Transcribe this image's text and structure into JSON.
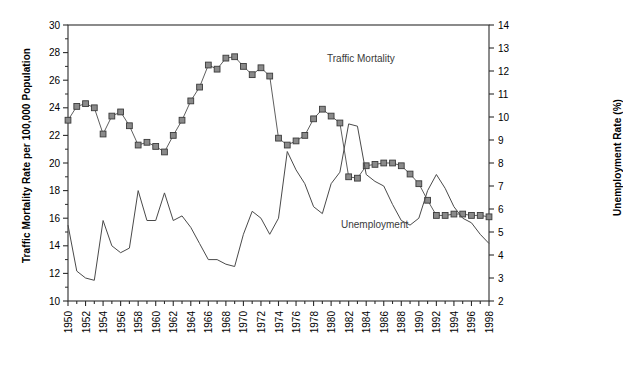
{
  "chart_data": {
    "type": "line",
    "title": "",
    "xlabel": "",
    "ylabel": "Traffic Mortality Rate per 100,000 Population",
    "y2label": "Unemployment Rate (%)",
    "grid": false,
    "legend_position": "inline-annotation",
    "xlim": [
      1950,
      1998
    ],
    "ylim": [
      10,
      30
    ],
    "y2lim": [
      2,
      14
    ],
    "yticks": [
      10,
      12,
      14,
      16,
      18,
      20,
      22,
      24,
      26,
      28,
      30
    ],
    "y2ticks": [
      2,
      3,
      4,
      5,
      6,
      7,
      8,
      9,
      10,
      11,
      12,
      13,
      14
    ],
    "xticks": [
      1950,
      1952,
      1954,
      1956,
      1958,
      1960,
      1962,
      1964,
      1966,
      1968,
      1970,
      1972,
      1974,
      1976,
      1978,
      1980,
      1982,
      1984,
      1986,
      1988,
      1990,
      1992,
      1994,
      1996,
      1998
    ],
    "x": [
      1950,
      1951,
      1952,
      1953,
      1954,
      1955,
      1956,
      1957,
      1958,
      1959,
      1960,
      1961,
      1962,
      1963,
      1964,
      1965,
      1966,
      1967,
      1968,
      1969,
      1970,
      1971,
      1972,
      1973,
      1974,
      1975,
      1976,
      1977,
      1978,
      1979,
      1980,
      1981,
      1982,
      1983,
      1984,
      1985,
      1986,
      1987,
      1988,
      1989,
      1990,
      1991,
      1992,
      1993,
      1994,
      1995,
      1996,
      1997,
      1998
    ],
    "series": [
      {
        "name": "Traffic Mortality",
        "axis": "left",
        "marker": "square",
        "color": "#5f5f5f",
        "annotation": "Traffic Mortality",
        "values": [
          23.1,
          24.1,
          24.3,
          24.0,
          22.1,
          23.4,
          23.7,
          22.7,
          21.3,
          21.5,
          21.2,
          20.8,
          22.0,
          23.1,
          24.5,
          25.5,
          27.1,
          26.8,
          27.6,
          27.7,
          27.0,
          26.4,
          26.9,
          26.3,
          21.8,
          21.3,
          21.6,
          22.0,
          23.2,
          23.9,
          23.4,
          22.9,
          19.0,
          18.9,
          19.8,
          19.9,
          20.0,
          20.0,
          19.8,
          19.2,
          18.5,
          17.3,
          16.2,
          16.2,
          16.3,
          16.3,
          16.2,
          16.2,
          16.1
        ]
      },
      {
        "name": "Unemployment",
        "axis": "right",
        "marker": "none",
        "color": "#4a4a4a",
        "annotation": "Unemployment",
        "values": [
          5.3,
          3.3,
          3.0,
          2.9,
          5.5,
          4.4,
          4.1,
          4.3,
          6.8,
          5.5,
          5.5,
          6.7,
          5.5,
          5.7,
          5.2,
          4.5,
          3.8,
          3.8,
          3.6,
          3.5,
          4.9,
          5.9,
          5.6,
          4.9,
          5.6,
          8.5,
          7.7,
          7.1,
          6.1,
          5.8,
          7.1,
          7.6,
          9.7,
          9.6,
          7.5,
          7.2,
          7.0,
          6.2,
          5.5,
          5.3,
          5.6,
          6.8,
          7.5,
          6.9,
          6.1,
          5.6,
          5.4,
          4.9,
          4.5
        ]
      }
    ]
  }
}
